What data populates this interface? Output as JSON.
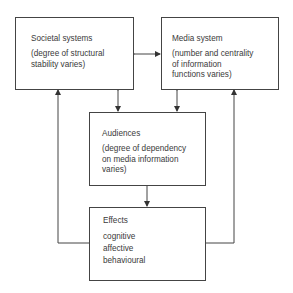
{
  "diagram": {
    "type": "flow",
    "nodes": {
      "societal": {
        "title": "Societal systems",
        "desc": "(degree of structural\nstability varies)"
      },
      "media": {
        "title": "Media system",
        "desc": "(number and centrality\nof information\nfunctions varies)"
      },
      "audiences": {
        "title": "Audiences",
        "desc": "(degree of dependency\non media information\nvaries)"
      },
      "effects": {
        "title": "Effects",
        "desc": "cognitive\naffective\nbehavioural"
      }
    },
    "edges": [
      {
        "from": "societal",
        "to": "media",
        "direction": "both"
      },
      {
        "from": "societal",
        "to": "audiences",
        "direction": "both"
      },
      {
        "from": "media",
        "to": "audiences",
        "direction": "both"
      },
      {
        "from": "audiences",
        "to": "effects",
        "direction": "forward"
      },
      {
        "from": "effects",
        "to": "societal",
        "direction": "forward"
      },
      {
        "from": "effects",
        "to": "media",
        "direction": "forward"
      }
    ],
    "colors": {
      "line": "#444444",
      "text": "#3a3a3a",
      "background": "#ffffff"
    }
  }
}
